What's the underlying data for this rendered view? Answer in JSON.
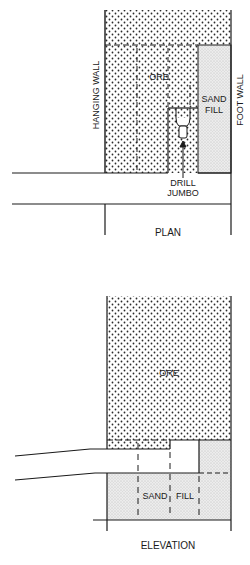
{
  "diagram": {
    "type": "mining stope cross-section (cut-and-fill)",
    "plan": {
      "caption": "PLAN",
      "labels": {
        "ore": "ORE",
        "sand_fill_line1": "SAND",
        "sand_fill_line2": "FILL",
        "hanging_wall": "HANGING WALL",
        "foot_wall": "FOOT WALL",
        "drill_line1": "DRILL",
        "drill_line2": "JUMBO"
      }
    },
    "elevation": {
      "caption": "ELEVATION",
      "labels": {
        "ore": "ORE",
        "sand": "SAND",
        "fill": "FILL"
      }
    },
    "colors": {
      "line": "#1a1a1a",
      "ore_dots": "#2a2a2a",
      "sand_fill": "#e6e6e6",
      "background": "#ffffff"
    }
  }
}
